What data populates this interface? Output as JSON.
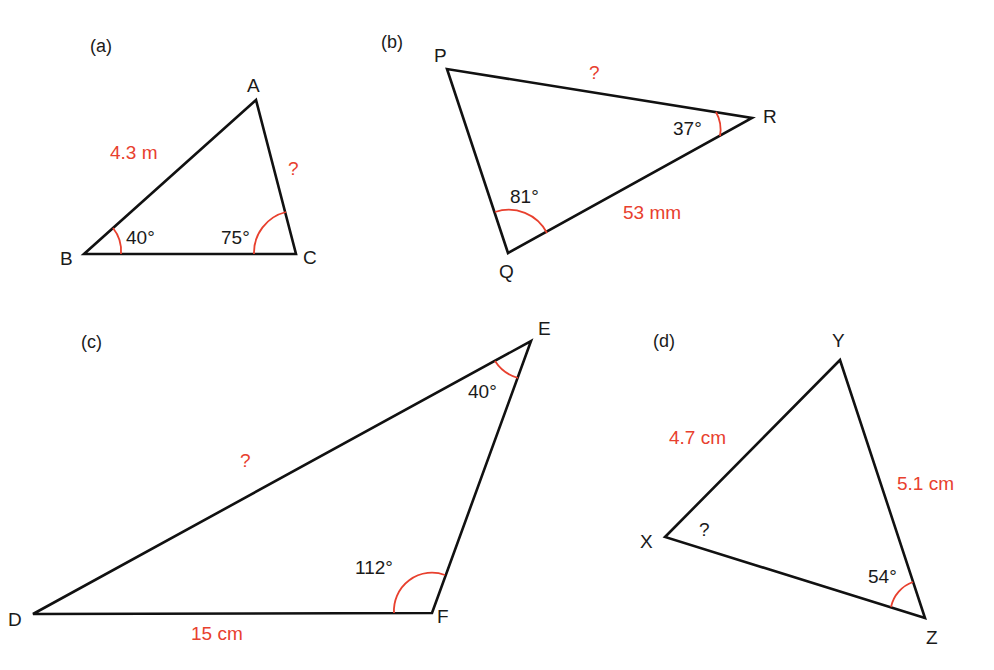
{
  "colors": {
    "line": "#111111",
    "highlight": "#e8402e",
    "text": "#1a1a1a"
  },
  "triangles": [
    {
      "id": "a",
      "tag": "(a)",
      "vertices": [
        {
          "name": "A",
          "x": 256,
          "y": 100
        },
        {
          "name": "B",
          "x": 84,
          "y": 254
        },
        {
          "name": "C",
          "x": 296,
          "y": 254
        }
      ],
      "sides": [
        {
          "between": "AB",
          "label": "4.3 m"
        },
        {
          "between": "AC",
          "label": "?"
        }
      ],
      "angles": [
        {
          "at": "B",
          "label": "40°"
        },
        {
          "at": "C",
          "label": "75°"
        }
      ]
    },
    {
      "id": "b",
      "tag": "(b)",
      "vertices": [
        {
          "name": "P",
          "x": 447,
          "y": 69
        },
        {
          "name": "Q",
          "x": 508,
          "y": 253
        },
        {
          "name": "R",
          "x": 752,
          "y": 118
        }
      ],
      "sides": [
        {
          "between": "PR",
          "label": "?"
        },
        {
          "between": "QR",
          "label": "53 mm"
        }
      ],
      "angles": [
        {
          "at": "Q",
          "label": "81°"
        },
        {
          "at": "R",
          "label": "37°"
        }
      ]
    },
    {
      "id": "c",
      "tag": "(c)",
      "vertices": [
        {
          "name": "D",
          "x": 33,
          "y": 614
        },
        {
          "name": "E",
          "x": 531,
          "y": 341
        },
        {
          "name": "F",
          "x": 432,
          "y": 613
        }
      ],
      "sides": [
        {
          "between": "DE",
          "label": "?"
        },
        {
          "between": "DF",
          "label": "15 cm"
        }
      ],
      "angles": [
        {
          "at": "E",
          "label": "40°"
        },
        {
          "at": "F",
          "label": "112°"
        }
      ]
    },
    {
      "id": "d",
      "tag": "(d)",
      "vertices": [
        {
          "name": "X",
          "x": 665,
          "y": 537
        },
        {
          "name": "Y",
          "x": 840,
          "y": 360
        },
        {
          "name": "Z",
          "x": 925,
          "y": 618
        }
      ],
      "sides": [
        {
          "between": "XY",
          "label": "4.7 cm"
        },
        {
          "between": "YZ",
          "label": "5.1 cm"
        }
      ],
      "angles": [
        {
          "at": "X",
          "label": "?"
        },
        {
          "at": "Z",
          "label": "54°"
        }
      ]
    }
  ]
}
